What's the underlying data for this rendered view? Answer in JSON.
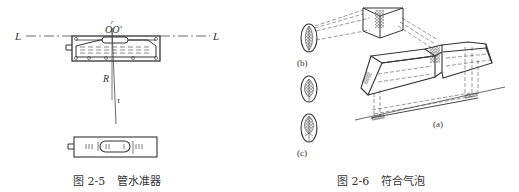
{
  "figures": [
    {
      "number": "图 2-5",
      "title": "管水准器",
      "labels": {
        "axis_left": "L",
        "axis_right": "L",
        "r": "r",
        "center": "OO'",
        "radius": "R",
        "tau": "τ"
      }
    },
    {
      "number": "图 2-6",
      "title": "符合气泡",
      "labels": {
        "a": "(a)",
        "b": "(b)",
        "c": "(c)"
      }
    }
  ],
  "colors": {
    "line": "#333333",
    "dash": "#555555",
    "background": "#ffffff"
  }
}
